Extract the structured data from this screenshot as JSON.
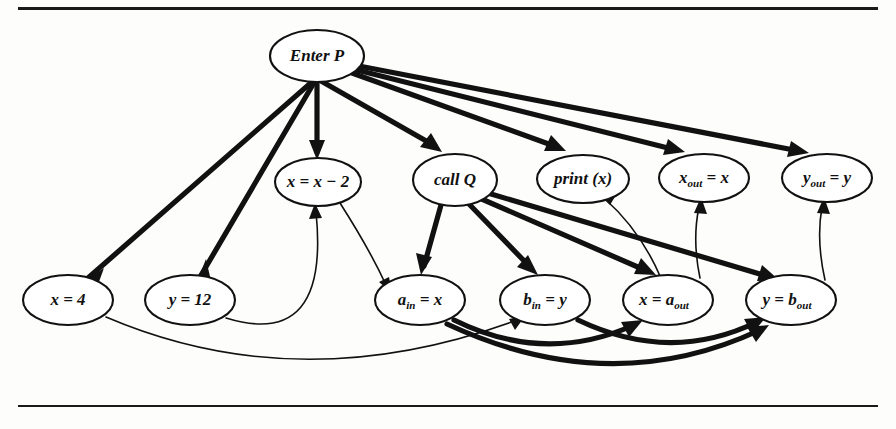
{
  "figure": {
    "type": "diagram",
    "kind": "program-dependence-graph",
    "rules": [
      "top-rule",
      "bottom-rule"
    ],
    "nodes": [
      {
        "id": "enter_p",
        "label": "Enter P",
        "text": "Enter P",
        "base": "Enter P",
        "sub": "",
        "tail": "",
        "cx": 317,
        "cy": 56,
        "rx": 47,
        "ry": 26
      },
      {
        "id": "x_dec",
        "label": "x = x - 2",
        "text": "x = x − 2",
        "base": "x = x − 2",
        "sub": "",
        "tail": "",
        "cx": 318,
        "cy": 182,
        "rx": 43,
        "ry": 24
      },
      {
        "id": "call_q",
        "label": "call Q",
        "text": "call Q",
        "base": "call Q",
        "sub": "",
        "tail": "",
        "cx": 455,
        "cy": 180,
        "rx": 42,
        "ry": 26
      },
      {
        "id": "print_x",
        "label": "print (x)",
        "text": "print (x)",
        "base": "print (x)",
        "sub": "",
        "tail": "",
        "cx": 583,
        "cy": 179,
        "rx": 46,
        "ry": 24
      },
      {
        "id": "x_out",
        "label": "x_out = x",
        "text": "x",
        "base": "x",
        "sub": "out",
        "tail": " = x",
        "cx": 704,
        "cy": 178,
        "rx": 45,
        "ry": 24
      },
      {
        "id": "y_out",
        "label": "y_out = y",
        "text": "y",
        "base": "y",
        "sub": "out",
        "tail": " = y",
        "cx": 827,
        "cy": 178,
        "rx": 45,
        "ry": 24
      },
      {
        "id": "x_4",
        "label": "x = 4",
        "text": "x = 4",
        "base": "x = 4",
        "sub": "",
        "tail": "",
        "cx": 68,
        "cy": 300,
        "rx": 45,
        "ry": 25
      },
      {
        "id": "y_12",
        "label": "y = 12",
        "text": "y = 12",
        "base": "y = 12",
        "sub": "",
        "tail": "",
        "cx": 190,
        "cy": 300,
        "rx": 45,
        "ry": 25
      },
      {
        "id": "a_in",
        "label": "a_in = x",
        "text": "a",
        "base": "a",
        "sub": "in",
        "tail": " = x",
        "cx": 420,
        "cy": 300,
        "rx": 45,
        "ry": 25
      },
      {
        "id": "b_in",
        "label": "b_in = y",
        "text": "b",
        "base": "b",
        "sub": "in",
        "tail": " = y",
        "cx": 545,
        "cy": 300,
        "rx": 45,
        "ry": 25
      },
      {
        "id": "x_aout",
        "label": "x = a_out",
        "text": "x = a",
        "base": "x = a",
        "sub": "out",
        "tail": "",
        "cx": 668,
        "cy": 300,
        "rx": 45,
        "ry": 25
      },
      {
        "id": "y_bout",
        "label": "y = b_out",
        "text": "y = b",
        "base": "y = b",
        "sub": "out",
        "tail": "",
        "cx": 791,
        "cy": 300,
        "rx": 45,
        "ry": 25
      }
    ],
    "edges": [
      {
        "id": "e1",
        "from": "enter_p",
        "to": "x_4",
        "weight": "thick"
      },
      {
        "id": "e2",
        "from": "enter_p",
        "to": "y_12",
        "weight": "thick"
      },
      {
        "id": "e3",
        "from": "enter_p",
        "to": "x_dec",
        "weight": "thick"
      },
      {
        "id": "e4",
        "from": "enter_p",
        "to": "call_q",
        "weight": "thick"
      },
      {
        "id": "e5",
        "from": "enter_p",
        "to": "print_x",
        "weight": "thick"
      },
      {
        "id": "e6",
        "from": "enter_p",
        "to": "x_out",
        "weight": "thick"
      },
      {
        "id": "e7",
        "from": "enter_p",
        "to": "y_out",
        "weight": "thick"
      },
      {
        "id": "e8",
        "from": "call_q",
        "to": "a_in",
        "weight": "thick"
      },
      {
        "id": "e9",
        "from": "call_q",
        "to": "b_in",
        "weight": "thick"
      },
      {
        "id": "e10",
        "from": "call_q",
        "to": "x_aout",
        "weight": "thick"
      },
      {
        "id": "e11",
        "from": "call_q",
        "to": "y_bout",
        "weight": "thick"
      },
      {
        "id": "e12",
        "from": "a_in",
        "to": "x_aout",
        "weight": "thick"
      },
      {
        "id": "e13",
        "from": "a_in",
        "to": "y_bout",
        "weight": "thick"
      },
      {
        "id": "e14",
        "from": "b_in",
        "to": "y_bout",
        "weight": "thick"
      },
      {
        "id": "e15",
        "from": "x_4",
        "to": "b_in",
        "weight": "thin"
      },
      {
        "id": "e16",
        "from": "y_12",
        "to": "x_dec",
        "weight": "thin"
      },
      {
        "id": "e17",
        "from": "x_dec",
        "to": "a_in",
        "weight": "thin"
      },
      {
        "id": "e18",
        "from": "x_aout",
        "to": "print_x",
        "weight": "thin"
      },
      {
        "id": "e19",
        "from": "x_aout",
        "to": "x_out",
        "weight": "thin"
      },
      {
        "id": "e20",
        "from": "y_bout",
        "to": "y_out",
        "weight": "thin"
      }
    ]
  }
}
